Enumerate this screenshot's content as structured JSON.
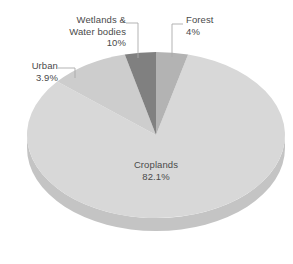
{
  "chart_data": {
    "type": "pie",
    "title": "",
    "subtitle": "",
    "xlabel": "",
    "ylabel": "",
    "legend_position": "none",
    "grid": false,
    "three_d": true,
    "categories": [
      "Forest",
      "Croplands",
      "Wetlands & Water bodies",
      "Urban"
    ],
    "values": [
      4,
      82.1,
      10,
      3.9
    ],
    "unit": "%",
    "slices": [
      {
        "name": "Forest",
        "label": "Forest",
        "value": 4,
        "value_text": "4%",
        "color": "#b3b3b3",
        "side_color": "#a3a3a3",
        "start_angle": 0,
        "end_angle": 14.4,
        "label_position": "outside-right"
      },
      {
        "name": "Croplands",
        "label": "Croplands",
        "value": 82.1,
        "value_text": "82.1%",
        "color": "#d8d8d8",
        "side_color": "#c4c4c4",
        "start_angle": 14.4,
        "end_angle": 310.0,
        "label_position": "inside"
      },
      {
        "name": "Wetlands & Water bodies",
        "label_line_1": "Wetlands &",
        "label_line_2": "Water bodies",
        "value": 10,
        "value_text": "10%",
        "color": "#cdcdcd",
        "side_color": "#bcbcbc",
        "start_angle": 310.0,
        "end_angle": 346.0,
        "label_position": "outside-top-left"
      },
      {
        "name": "Urban",
        "label": "Urban",
        "value": 3.9,
        "value_text": "3.9%",
        "color": "#808080",
        "side_color": "#737373",
        "start_angle": 346.0,
        "end_angle": 360.0,
        "label_position": "outside-left"
      }
    ],
    "colors": {
      "background": "#ffffff",
      "text": "#4a4a4a",
      "leader_line": "#aaaaaa",
      "forest": "#b3b3b3",
      "croplands": "#d8d8d8",
      "wetlands": "#cdcdcd",
      "urban": "#808080"
    }
  },
  "labels": {
    "wetlands": {
      "line1": "Wetlands &",
      "line2": "Water bodies",
      "value": "10%"
    },
    "urban": {
      "name": "Urban",
      "value": "3.9%"
    },
    "forest": {
      "name": "Forest",
      "value": "4%"
    },
    "croplands": {
      "name": "Croplands",
      "value": "82.1%"
    }
  }
}
